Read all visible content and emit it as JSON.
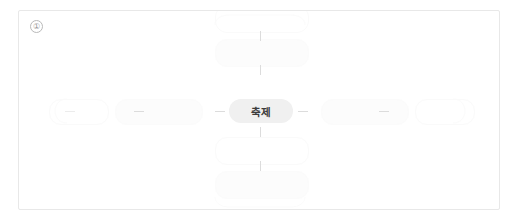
{
  "card": {
    "index_marker": "①",
    "background_color": "#ffffff",
    "border_color": "#e8e8e8"
  },
  "diagram": {
    "type": "mind-map",
    "center_node": {
      "label": "축제",
      "background_color": "#f0f0f0",
      "text_color": "#3c3c3c"
    },
    "ghost_nodes": [
      {
        "name": "ghost-node-top-far",
        "label": ""
      },
      {
        "name": "ghost-node-top",
        "label": ""
      },
      {
        "name": "ghost-node-bottom",
        "label": ""
      },
      {
        "name": "ghost-node-bottom-far",
        "label": ""
      },
      {
        "name": "ghost-node-left",
        "label": ""
      },
      {
        "name": "ghost-node-left-far",
        "label": ""
      },
      {
        "name": "ghost-node-right",
        "label": ""
      },
      {
        "name": "ghost-node-right-far",
        "label": ""
      }
    ],
    "connectors": [
      {
        "name": "connector-left-inner",
        "orientation": "horizontal"
      },
      {
        "name": "connector-left-mid",
        "orientation": "horizontal"
      },
      {
        "name": "connector-left-outer",
        "orientation": "horizontal"
      },
      {
        "name": "connector-right-inner",
        "orientation": "horizontal"
      },
      {
        "name": "connector-right-outer",
        "orientation": "horizontal"
      },
      {
        "name": "connector-top-inner",
        "orientation": "vertical"
      },
      {
        "name": "connector-top-outer",
        "orientation": "vertical"
      },
      {
        "name": "connector-bottom-inner",
        "orientation": "vertical"
      },
      {
        "name": "connector-bottom-outer",
        "orientation": "vertical"
      }
    ],
    "connector_color": "#dcdcdc",
    "ghost_color": "#fafafa"
  }
}
